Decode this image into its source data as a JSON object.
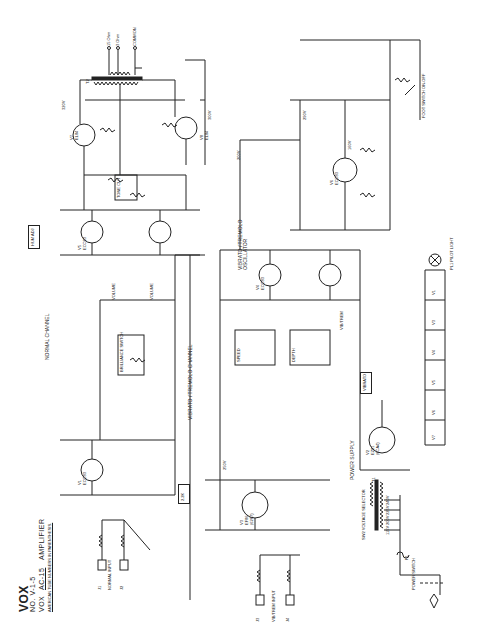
{
  "title_block": {
    "brand": "VOX",
    "drawing_no": "NO. V-1-5",
    "model_prefix": "VOX",
    "model": "AC-15",
    "model_suffix": "AMPLIFIER",
    "note": "AMERICAN TUBE NUMBERS IN PARENTHESIS."
  },
  "sections": {
    "normal_channel": "NORMAL CHANNEL",
    "vibrato_channel": "VIBRATO / TREMOLO CHANNEL",
    "oscillator": "VIBRATO / TREMOLO OSCILLATOR",
    "power_supply": "POWER SUPPLY"
  },
  "output_transformer": {
    "ref": "T2",
    "taps": [
      "15 Ohm",
      "3 Ohm",
      "COMMON"
    ]
  },
  "tubes": [
    {
      "ref": "V1",
      "type": "ECC83",
      "us": "(12AX7)"
    },
    {
      "ref": "V2",
      "type": "EZ81",
      "us": "(6CA4)"
    },
    {
      "ref": "V3",
      "type": "EF86",
      "us": "(6267)"
    },
    {
      "ref": "V4",
      "type": "ECC83",
      "us": "(12AX7)"
    },
    {
      "ref": "V5",
      "type": "ECC83",
      "us": "(12AX7)"
    },
    {
      "ref": "V6",
      "type": "ECC83",
      "us": "(12AX7)"
    },
    {
      "ref": "V7",
      "type": "EL84",
      "us": "(6BQ5)"
    },
    {
      "ref": "V8",
      "type": "EL84",
      "us": "(6BQ5)"
    }
  ],
  "controls": {
    "volume_normal": "VOLUME",
    "volume_vibrato": "VOLUME",
    "brilliance": "BRILLIANCE SWITCH",
    "tone_cut": "TONE CUT",
    "speed": "SPEED",
    "depth": "DEPTH",
    "vib_trem": "VIB/TREM",
    "foot_switch": "FOOT SWITCH ON-OFF"
  },
  "inputs": {
    "normal": [
      "J1",
      "J2"
    ],
    "normal_label": "NORMAL INPUT",
    "vibrato": [
      "J3",
      "J4"
    ],
    "vibrato_label": "VIB/TREM INPUT"
  },
  "power": {
    "transformer": "T1",
    "switch": "SW1",
    "switch_label": "POWER SWITCH",
    "selector_label": "SW2 VOLTAGE SELECTOR",
    "fuse": "F1",
    "voltage_taps": [
      "240V",
      "225V",
      "200V",
      "115V"
    ],
    "pilot": "PL1 PILOT LIGHT",
    "heaters": [
      "V1",
      "V3",
      "V4",
      "V5",
      "V6",
      "V7",
      "V8"
    ]
  },
  "voltages": {
    "b_plus_1": "320V",
    "b_plus_2": "300V",
    "b_plus_3": "290V",
    "b_plus_4": "250V",
    "b_plus_5": "200V",
    "osc_plate": "160V"
  },
  "boxes": {
    "hum_adj": "HUM ADJ",
    "note_a": "2.2K",
    "note_b": "VIBRATO"
  }
}
